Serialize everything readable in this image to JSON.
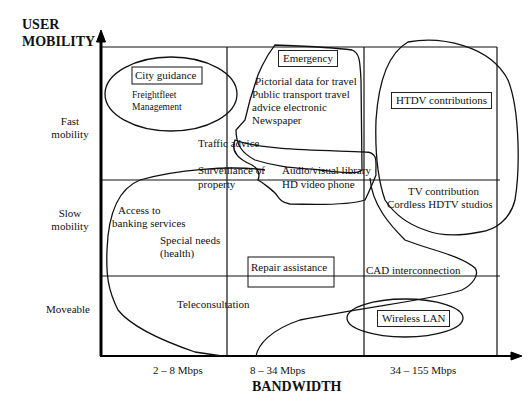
{
  "diagram": {
    "y_axis": {
      "title_line1": "USER",
      "title_line2": "MOBILITY",
      "rows": [
        {
          "line1": "Fast",
          "line2": "mobility"
        },
        {
          "line1": "Slow",
          "line2": "mobility"
        },
        {
          "line1": "Moveable",
          "line2": ""
        }
      ]
    },
    "x_axis": {
      "title": "BANDWIDTH",
      "columns": [
        "2 – 8 Mbps",
        "8 – 34 Mbps",
        "34 – 155 Mbps"
      ]
    },
    "boxed_labels": {
      "city_guidance": "City guidance",
      "emergency": "Emergency",
      "htdv": "HTDV contributions",
      "repair": "Repair assistance",
      "wireless_lan": "Wireless LAN"
    },
    "labels": {
      "freightfleet_1": "Freightfleet",
      "freightfleet_2": "Management",
      "pictorial": "Pictorial data for travel",
      "public_transport": "Public transport travel",
      "advice_electronic": "advice electronic",
      "newspaper": "Newspaper",
      "traffic_advice": "Traffic advice",
      "surveillance_1": "Surveillance of",
      "surveillance_2": "property",
      "av_library": "Audio/visual library",
      "hd_video_phone": "HD video phone",
      "tv_contribution": "TV contribution",
      "cordless_hdtv": "Cordless HDTV studios",
      "banking_1": "Access to",
      "banking_2": "banking services",
      "special_1": "Special needs",
      "special_2": "(health)",
      "cad": "CAD interconnection",
      "teleconsultation": "Teleconsultation"
    }
  }
}
